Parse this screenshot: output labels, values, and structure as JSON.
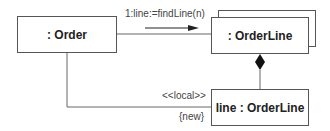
{
  "diagram": {
    "type": "UML collaboration diagram",
    "objects": {
      "order": {
        "label": ": Order"
      },
      "orderline_multi": {
        "label": ": OrderLine",
        "multiobject": true
      },
      "line": {
        "label": "line : OrderLine"
      }
    },
    "links": {
      "message": {
        "label": "1:line:=findLine(n)",
        "direction": "order-to-orderline"
      },
      "composition": {
        "from": "orderline_multi",
        "to": "line",
        "adornment": "filled-diamond"
      },
      "local_link": {
        "stereotype": "<<local>>",
        "constraint": "{new}"
      }
    },
    "colors": {
      "line": "#555555",
      "text": "#222222",
      "background": "#ffffff"
    }
  }
}
